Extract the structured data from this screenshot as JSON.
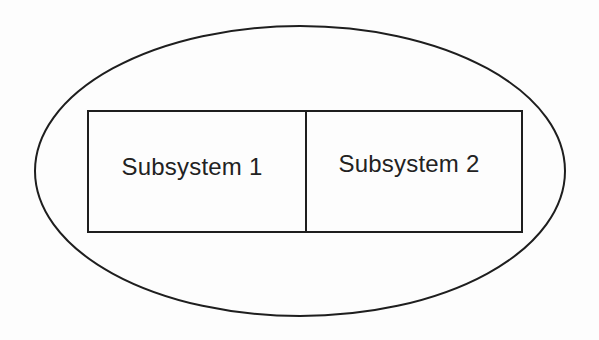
{
  "diagram": {
    "type": "containment",
    "container": {
      "shape": "ellipse",
      "label": ""
    },
    "subsystems": [
      {
        "id": "subsystem-1",
        "label": "Subsystem 1"
      },
      {
        "id": "subsystem-2",
        "label": "Subsystem 2"
      }
    ],
    "colors": {
      "stroke": "#1e1e1e",
      "text": "#222222",
      "background": "#fdfdfd"
    }
  }
}
